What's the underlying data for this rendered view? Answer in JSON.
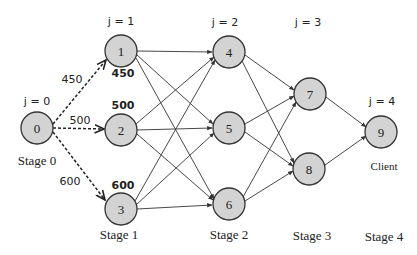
{
  "diagram": {
    "type": "multistage-network",
    "nodes": [
      {
        "id": "0",
        "label": "0",
        "x": 37,
        "y": 128,
        "stage": 0
      },
      {
        "id": "1",
        "label": "1",
        "x": 121,
        "y": 51,
        "stage": 1
      },
      {
        "id": "2",
        "label": "2",
        "x": 121,
        "y": 130,
        "stage": 1
      },
      {
        "id": "3",
        "label": "3",
        "x": 121,
        "y": 209,
        "stage": 1
      },
      {
        "id": "4",
        "label": "4",
        "x": 229,
        "y": 52,
        "stage": 2
      },
      {
        "id": "5",
        "label": "5",
        "x": 229,
        "y": 128,
        "stage": 2
      },
      {
        "id": "6",
        "label": "6",
        "x": 229,
        "y": 204,
        "stage": 2
      },
      {
        "id": "7",
        "label": "7",
        "x": 310,
        "y": 94,
        "stage": 3
      },
      {
        "id": "8",
        "label": "8",
        "x": 309,
        "y": 169,
        "stage": 3
      },
      {
        "id": "9",
        "label": "9",
        "x": 381,
        "y": 132,
        "stage": 4
      }
    ],
    "edges": [
      {
        "from": "0",
        "to": "1",
        "style": "dashed",
        "weight": "450"
      },
      {
        "from": "0",
        "to": "2",
        "style": "dashed",
        "weight": "500"
      },
      {
        "from": "0",
        "to": "3",
        "style": "dashed",
        "weight": "600"
      },
      {
        "from": "1",
        "to": "4",
        "style": "solid"
      },
      {
        "from": "1",
        "to": "5",
        "style": "solid"
      },
      {
        "from": "1",
        "to": "6",
        "style": "solid"
      },
      {
        "from": "2",
        "to": "4",
        "style": "solid"
      },
      {
        "from": "2",
        "to": "5",
        "style": "solid"
      },
      {
        "from": "2",
        "to": "6",
        "style": "solid"
      },
      {
        "from": "3",
        "to": "4",
        "style": "solid"
      },
      {
        "from": "3",
        "to": "5",
        "style": "solid"
      },
      {
        "from": "3",
        "to": "6",
        "style": "solid"
      },
      {
        "from": "4",
        "to": "7",
        "style": "solid"
      },
      {
        "from": "4",
        "to": "8",
        "style": "solid"
      },
      {
        "from": "5",
        "to": "7",
        "style": "solid"
      },
      {
        "from": "5",
        "to": "8",
        "style": "solid"
      },
      {
        "from": "6",
        "to": "7",
        "style": "solid"
      },
      {
        "from": "6",
        "to": "8",
        "style": "solid"
      },
      {
        "from": "7",
        "to": "9",
        "style": "solid"
      },
      {
        "from": "8",
        "to": "9",
        "style": "solid"
      }
    ],
    "edge_weights": {
      "w01": "450",
      "w02": "500",
      "w03": "600"
    },
    "capacities": {
      "node1": "450",
      "node2": "500",
      "node3": "600"
    },
    "j_labels": {
      "j0": "j = 0",
      "j1": "j = 1",
      "j2": "j = 2",
      "j3": "j = 3",
      "j4": "j = 4"
    },
    "stage_labels": {
      "s0": "Stage 0",
      "s1": "Stage 1",
      "s2": "Stage 2",
      "s3": "Stage 3",
      "s4": "Stage 4"
    },
    "client_label": "Client",
    "colors": {
      "node_fill": "#d3d3d3",
      "node_stroke": "#333333",
      "edge": "#333333",
      "background": "#ffffff"
    }
  }
}
